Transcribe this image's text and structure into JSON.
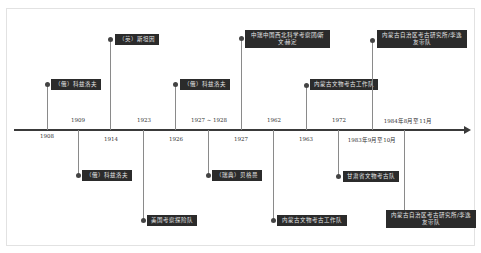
{
  "title": "",
  "colors": {
    "axis": "#3a3a3a",
    "label_bg": "#2b2b2b",
    "label_text": "#e6e6e6",
    "stem": "#8a8a8a"
  },
  "events_above": [
    {
      "year": "1908",
      "label": "（俄）科兹洛夫"
    },
    {
      "year": "1914",
      "label": "（英）斯坦因"
    },
    {
      "year": "1926",
      "label": "（俄）科兹洛夫"
    },
    {
      "year": "1927",
      "label": "中瑞中国西北科学考察团/斯文·赫定"
    },
    {
      "year": "1963",
      "label": "内蒙古文物考古工作队"
    },
    {
      "year": "1983年9月至10月",
      "label": "内蒙古自治区考古研究所/李逸友带队"
    }
  ],
  "events_below": [
    {
      "year": "1909",
      "label": "（俄）科兹洛夫"
    },
    {
      "year": "1923",
      "label": "美国考察探险队"
    },
    {
      "year": "1927 ~ 1928",
      "label": "（瑞典）贝格曼"
    },
    {
      "year": "1962",
      "label": "内蒙古文物考古工作队"
    },
    {
      "year": "1972",
      "label": "甘肃省文物考古队"
    },
    {
      "year": "1984年8月至11月",
      "label": "内蒙古自治区考古研究所/李逸友带队"
    }
  ]
}
